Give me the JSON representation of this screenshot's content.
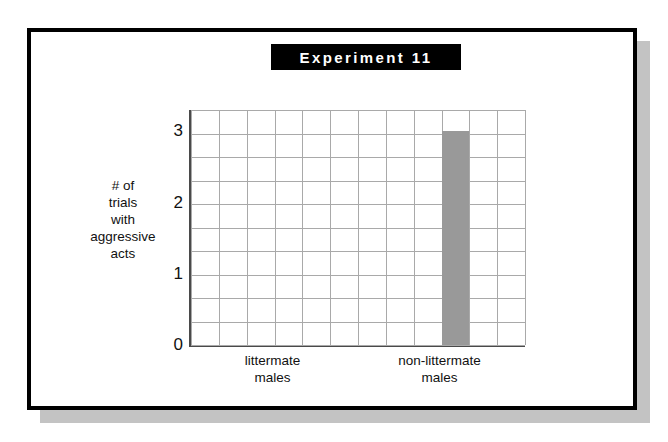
{
  "figure": {
    "title": "Experiment 11",
    "frame_color": "#000000",
    "shadow_color": "#c3c3c3",
    "background": "#ffffff"
  },
  "chart_data": {
    "type": "bar",
    "title": "Experiment 11",
    "xlabel": "",
    "ylabel": "# of trials with aggressive acts",
    "ylabel_lines": [
      "# of",
      "trials",
      "with",
      "aggressive",
      "acts"
    ],
    "categories": [
      "littermate males",
      "non-littermate males"
    ],
    "category_lines": [
      [
        "littermate",
        "males"
      ],
      [
        "non-littermate",
        "males"
      ]
    ],
    "values": [
      0,
      3
    ],
    "ylim": [
      0,
      3.3
    ],
    "yticks": [
      0,
      1,
      2,
      3
    ],
    "ytick_labels": [
      "0",
      "1",
      "2",
      "3"
    ],
    "grid": true,
    "grid_color": "#a9a9a9",
    "grid_rows": 10,
    "grid_cols": 12,
    "bar_color": "#999999",
    "axis_color": "#4a4a4a",
    "legend": null,
    "bar_column_index": 9,
    "bar_width_columns": 1
  }
}
